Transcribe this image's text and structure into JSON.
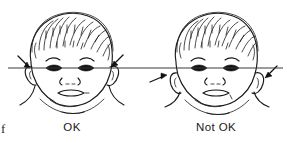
{
  "figure": {
    "kind": "clinical-line-drawing",
    "background_color": "#ffffff",
    "ink_color": "#1a1a1a",
    "reference_line_color": "#3a3a3a",
    "reference_line_label": "eye-level horizontal reference line",
    "edge_fragment": "f"
  },
  "panels": [
    {
      "id": "left",
      "caption": "OK",
      "subject": "infant-face-front-view",
      "ear_position": "normal-set ears, top of ear meets the eye-level line",
      "arrow_count": 2,
      "arrows": [
        {
          "name": "arrow-left-ear-ok",
          "direction": "down-left",
          "target": "left-ear-top"
        },
        {
          "name": "arrow-right-ear-ok",
          "direction": "down-left",
          "target": "right-ear-top"
        }
      ]
    },
    {
      "id": "right",
      "caption": "Not OK",
      "subject": "infant-face-front-view",
      "ear_position": "low-set ears, entire ear sits below the eye-level line",
      "arrow_count": 2,
      "arrows": [
        {
          "name": "arrow-left-ear-not-ok",
          "direction": "up-right",
          "target": "left-ear-low"
        },
        {
          "name": "arrow-right-ear-not-ok",
          "direction": "down-left",
          "target": "right-ear-low"
        }
      ]
    }
  ]
}
